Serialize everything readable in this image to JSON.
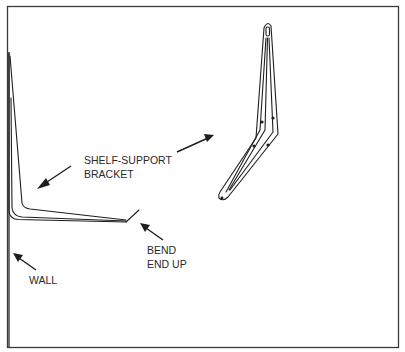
{
  "figure": {
    "labels": {
      "shelf_support_line1": "SHELF-SUPPORT",
      "shelf_support_line2": "BRACKET",
      "bend_line1": "BEND",
      "bend_line2": "END UP",
      "wall": "WALL"
    },
    "colors": {
      "ink": "#1e1e1e",
      "background": "#ffffff"
    }
  }
}
